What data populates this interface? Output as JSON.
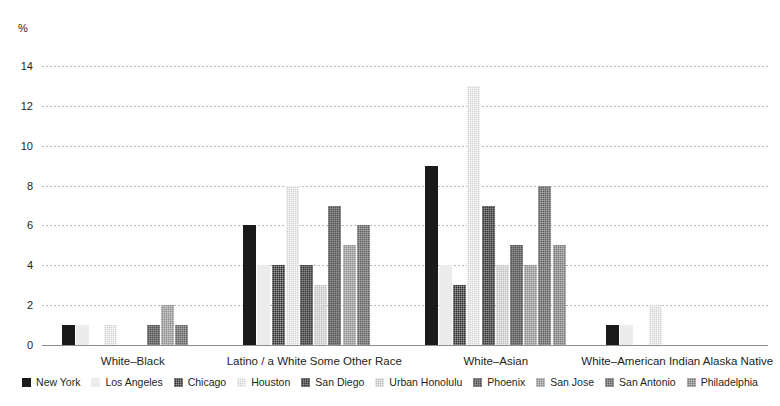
{
  "chart_data": {
    "type": "bar",
    "title": "",
    "subtitle": "",
    "xlabel": "",
    "ylabel": "%",
    "unit_label": "%",
    "ylim": [
      0,
      14
    ],
    "yticks": [
      0,
      2,
      4,
      6,
      8,
      10,
      12,
      14
    ],
    "grid": true,
    "legend_position": "bottom",
    "categories": [
      "White–Black",
      "Latino / a White Some Other Race",
      "White–Asian",
      "White–American Indian Alaska Native"
    ],
    "series": [
      {
        "name": "New York",
        "color": "#1a1a1a",
        "values": [
          1,
          6,
          9,
          1
        ]
      },
      {
        "name": "Los Angeles",
        "color": "#ececec",
        "values": [
          1,
          4,
          4,
          1
        ]
      },
      {
        "name": "Chicago",
        "color": "#2b2b2b",
        "values": [
          0,
          4,
          3,
          0
        ]
      },
      {
        "name": "Houston",
        "color": "#d3d3d3",
        "values": [
          1,
          8,
          13,
          2
        ]
      },
      {
        "name": "San Diego",
        "color": "#3b3b3b",
        "values": [
          0,
          4,
          7,
          0
        ]
      },
      {
        "name": "Urban Honolulu",
        "color": "#bdbdbd",
        "values": [
          0,
          3,
          4,
          0
        ]
      },
      {
        "name": "Phoenix",
        "color": "#555555",
        "values": [
          1,
          7,
          5,
          0
        ]
      },
      {
        "name": "San Jose",
        "color": "#8e8e8e",
        "values": [
          2,
          5,
          4,
          0
        ]
      },
      {
        "name": "San Antonio",
        "color": "#616161",
        "values": [
          1,
          6,
          8,
          0
        ]
      },
      {
        "name": "Philadelphia",
        "color": "#7a7a7a",
        "values": [
          0,
          0,
          5,
          0
        ]
      }
    ]
  }
}
